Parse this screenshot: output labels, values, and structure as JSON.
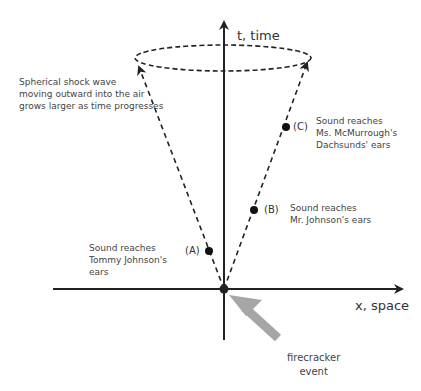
{
  "diagram": {
    "axes": {
      "t_label": "t, time",
      "x_label": "x, space"
    },
    "annotations": {
      "shock_wave": "Spherical shock wave\nmoving outward into the air\ngrows larger as time progresses",
      "event": "firecracker\nevent"
    },
    "points": [
      {
        "id": "A",
        "label": "(A)",
        "text": "Sound reaches\nTommy Johnson's\nears"
      },
      {
        "id": "B",
        "label": "(B)",
        "text": "Sound reaches\nMr. Johnson's ears"
      },
      {
        "id": "C",
        "label": "(C)",
        "text": "Sound reaches\nMs. McMurrough's\nDachsunds' ears"
      }
    ],
    "colors": {
      "line": "#222222",
      "event_arrow": "#a6a6a6"
    }
  }
}
